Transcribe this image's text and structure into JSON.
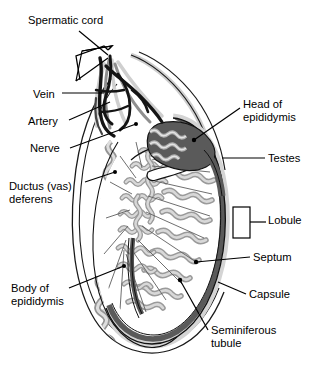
{
  "figure": {
    "type": "anatomical-diagram",
    "background_color": "#ffffff",
    "line_color": "#000000",
    "palette": {
      "tubule_gray": "#b9b9b9",
      "tubule_outline": "#6e6e6e",
      "capsule_dark": "#555555",
      "capsule_mid": "#8c8c8c",
      "capsule_light": "#d0d0d0",
      "vein_black": "#111111",
      "artery_gray": "#8f8f8f",
      "nerve_light": "#cfcfcf",
      "scrotal_wall": "#e8e8e8"
    }
  },
  "labels": [
    {
      "id": "spermatic-cord",
      "text": "Spermatic cord",
      "x": 28,
      "y": 14,
      "align": "left"
    },
    {
      "id": "vein",
      "text": "Vein",
      "x": 33,
      "y": 88,
      "align": "left"
    },
    {
      "id": "artery",
      "text": "Artery",
      "x": 28,
      "y": 115,
      "align": "left"
    },
    {
      "id": "nerve",
      "text": "Nerve",
      "x": 30,
      "y": 142,
      "align": "left"
    },
    {
      "id": "ductus-vas-deferens",
      "text": "Ductus (vas)\ndeferens",
      "x": 9,
      "y": 180,
      "align": "left"
    },
    {
      "id": "body-of-epididymis",
      "text": "Body of\nepididymis",
      "x": 11,
      "y": 282,
      "align": "left"
    },
    {
      "id": "head-of-epididymis",
      "text": "Head of\nepididymis",
      "x": 243,
      "y": 98,
      "align": "left"
    },
    {
      "id": "testes",
      "text": "Testes",
      "x": 268,
      "y": 152,
      "align": "left"
    },
    {
      "id": "lobule",
      "text": "Lobule",
      "x": 268,
      "y": 214,
      "align": "left"
    },
    {
      "id": "septum",
      "text": "Septum",
      "x": 253,
      "y": 251,
      "align": "left"
    },
    {
      "id": "capsule",
      "text": "Capsule",
      "x": 249,
      "y": 288,
      "align": "left"
    },
    {
      "id": "seminiferous-tubule",
      "text": "Seminiferous\ntubule",
      "x": 211,
      "y": 324,
      "align": "left"
    }
  ],
  "structures": [
    {
      "id": "spermatic-cord",
      "name": "Spermatic cord"
    },
    {
      "id": "vein",
      "name": "Vein"
    },
    {
      "id": "artery",
      "name": "Artery"
    },
    {
      "id": "nerve",
      "name": "Nerve"
    },
    {
      "id": "ductus-vas-deferens",
      "name": "Ductus (vas) deferens"
    },
    {
      "id": "head-of-epididymis",
      "name": "Head of epididymis"
    },
    {
      "id": "body-of-epididymis",
      "name": "Body of epididymis"
    },
    {
      "id": "testes",
      "name": "Testes"
    },
    {
      "id": "lobule",
      "name": "Lobule"
    },
    {
      "id": "septum",
      "name": "Septum"
    },
    {
      "id": "capsule",
      "name": "Capsule"
    },
    {
      "id": "seminiferous-tubule",
      "name": "Seminiferous tubule"
    }
  ]
}
